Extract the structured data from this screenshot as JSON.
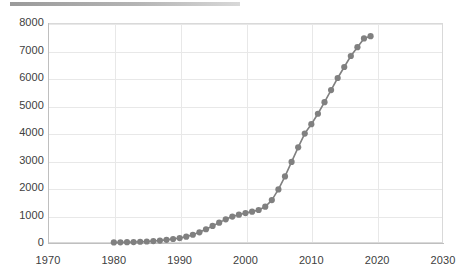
{
  "chart_data": {
    "type": "line",
    "title": "",
    "subtitle": "",
    "xlabel": "",
    "ylabel": "",
    "xlim": [
      1970,
      2030
    ],
    "ylim": [
      0,
      8000
    ],
    "grid": true,
    "legend": "none",
    "marker": {
      "shape": "circle",
      "size": 5,
      "color": "#808080"
    },
    "line": {
      "color": "#808080",
      "width": 1.6
    },
    "x_ticks": [
      1970,
      1980,
      1990,
      2000,
      2010,
      2020,
      2030
    ],
    "y_ticks": [
      0,
      1000,
      2000,
      3000,
      4000,
      5000,
      6000,
      7000,
      8000
    ],
    "x_tick_labels": [
      "1970",
      "1980",
      "1990",
      "2000",
      "2010",
      "2020",
      "2030"
    ],
    "y_tick_labels": [
      "0",
      "1000",
      "2000",
      "3000",
      "4000",
      "5000",
      "6000",
      "7000",
      "8000"
    ],
    "series": [
      {
        "name": "series-1",
        "x": [
          1980,
          1981,
          1982,
          1983,
          1984,
          1985,
          1986,
          1987,
          1988,
          1989,
          1990,
          1991,
          1992,
          1993,
          1994,
          1995,
          1996,
          1997,
          1998,
          1999,
          2000,
          2001,
          2002,
          2003,
          2004,
          2005,
          2006,
          2007,
          2008,
          2009,
          2010,
          2011,
          2012,
          2013,
          2014,
          2015,
          2016,
          2017,
          2018,
          2019
        ],
        "values": [
          20,
          25,
          30,
          35,
          45,
          55,
          70,
          90,
          115,
          145,
          180,
          230,
          300,
          390,
          500,
          620,
          740,
          860,
          960,
          1030,
          1090,
          1140,
          1200,
          1320,
          1560,
          1950,
          2420,
          2950,
          3480,
          3980,
          4320,
          4700,
          5120,
          5560,
          6000,
          6400,
          6800,
          7120,
          7440,
          7520
        ]
      }
    ]
  },
  "header": {
    "bar_label": ""
  }
}
